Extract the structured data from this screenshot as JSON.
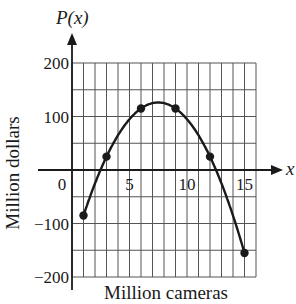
{
  "chart_data": {
    "type": "line",
    "title": "",
    "function_label": "P(x)",
    "x_axis_symbol": "x",
    "xlabel": "Million cameras",
    "ylabel": "Million dollars",
    "xlim": [
      0,
      16
    ],
    "ylim": [
      -200,
      200
    ],
    "x_ticks": [
      0,
      5,
      10,
      15
    ],
    "x_tick_labels": [
      "0",
      "5",
      "10",
      "15"
    ],
    "y_ticks": [
      200,
      100,
      -100,
      -200
    ],
    "y_tick_labels": [
      "200",
      "100",
      "−100",
      "−200"
    ],
    "grid": true,
    "grid_x_step": 1,
    "grid_y_step": 50,
    "legend": null,
    "series": [
      {
        "name": "P(x)",
        "curve": "smooth parabola",
        "x_range": [
          1,
          15
        ],
        "x": [
          1,
          3,
          6,
          9,
          12,
          15
        ],
        "values": [
          -85,
          25,
          115,
          115,
          25,
          -155
        ],
        "marked_points": true
      }
    ],
    "annotations": [
      "maximum near x = 7.5, P ≈ 126"
    ]
  },
  "colors": {
    "grid": "#555555",
    "axis": "#1a1a1a",
    "curve": "#1a1a1a",
    "background": "#ffffff"
  }
}
